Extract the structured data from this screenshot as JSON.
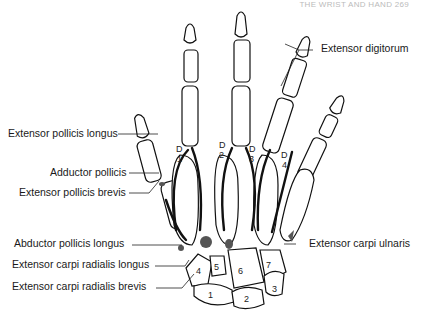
{
  "header": {
    "text": "THE WRIST AND HAND   269"
  },
  "labels": {
    "extensor_digitorum": "Extensor digitorum",
    "extensor_pollicis_longus": "Extensor pollicis longus",
    "adductor_pollicis": "Adductor pollicis",
    "extensor_pollicis_brevis": "Extensor pollicis brevis",
    "abductor_pollicis_longus": "Abductor pollicis longus",
    "extensor_carpi_radialis_longus": "Extensor carpi radialis longus",
    "extensor_carpi_radialis_brevis": "Extensor carpi radialis brevis",
    "extensor_carpi_ulnaris": "Extensor carpi ulnaris"
  },
  "digit_labels": [
    {
      "letter": "D",
      "num": "1"
    },
    {
      "letter": "D",
      "num": "2"
    },
    {
      "letter": "D",
      "num": "3"
    },
    {
      "letter": "D",
      "num": "4"
    }
  ],
  "compartments": [
    "1",
    "2",
    "3",
    "4",
    "5",
    "6",
    "7"
  ]
}
